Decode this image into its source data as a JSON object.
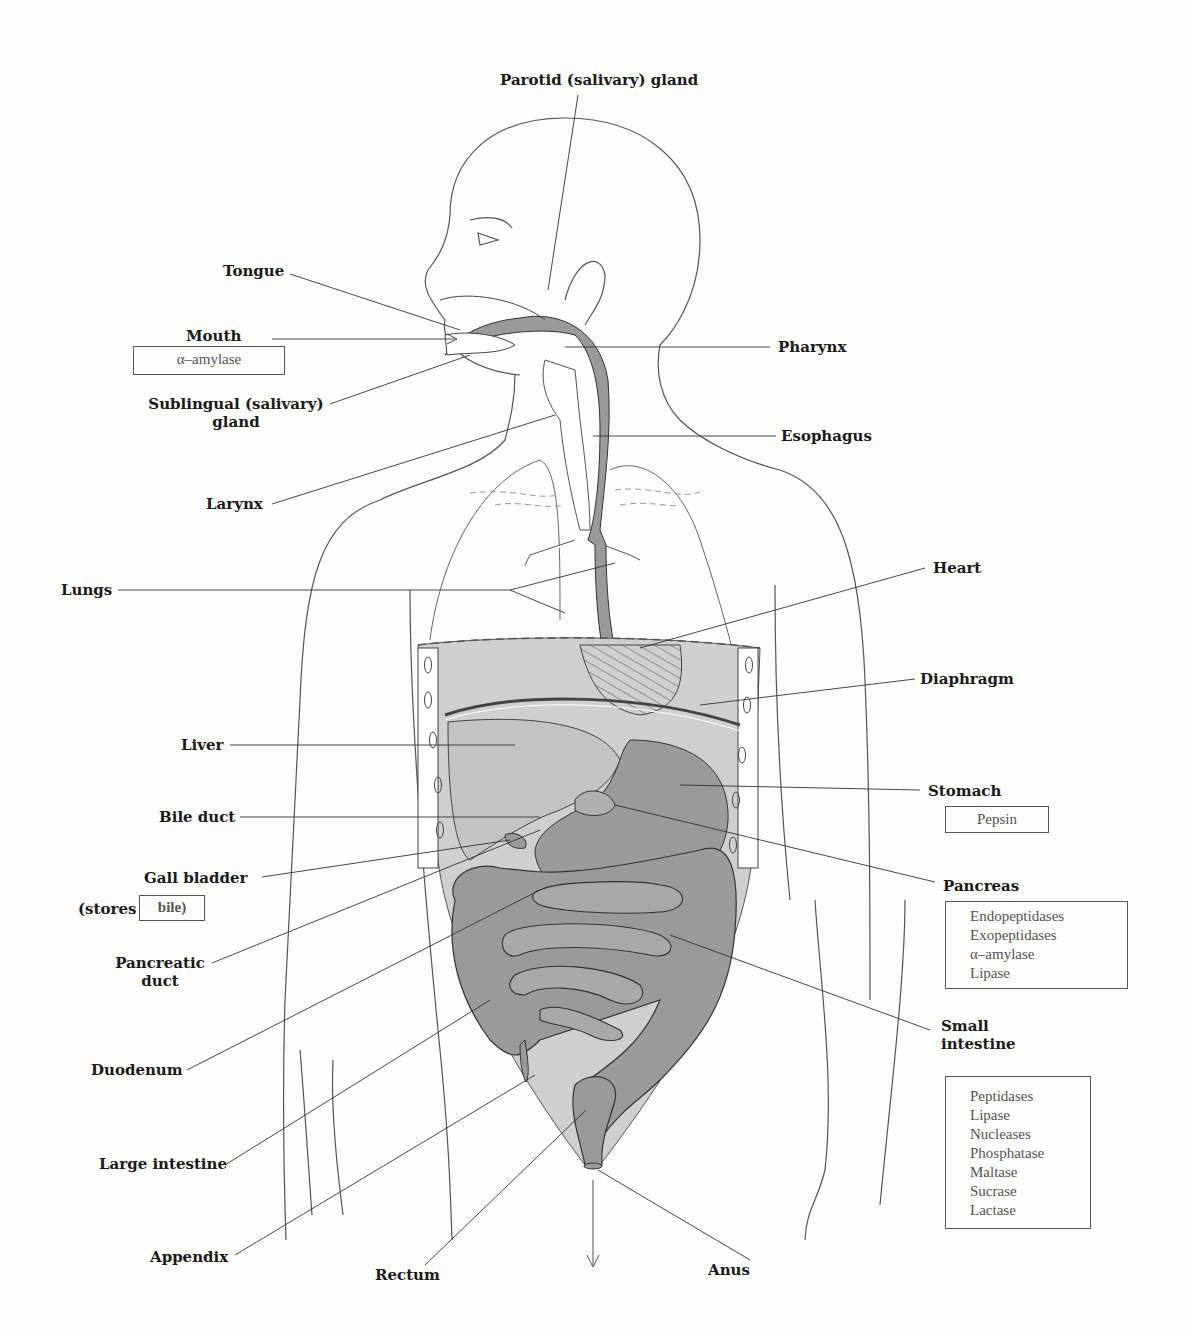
{
  "diagram": {
    "labels": {
      "parotid": "Parotid (salivary) gland",
      "tongue": "Tongue",
      "mouth": "Mouth",
      "sublingual_line1": "Sublingual (salivary)",
      "sublingual_line2": "gland",
      "larynx": "Larynx",
      "lungs": "Lungs",
      "liver": "Liver",
      "bile_duct": "Bile duct",
      "gall_bladder": "Gall bladder",
      "stores_prefix": "(stores",
      "pancreatic_duct_line1": "Pancreatic",
      "pancreatic_duct_line2": "duct",
      "duodenum": "Duodenum",
      "large_intestine": "Large intestine",
      "appendix": "Appendix",
      "rectum": "Rectum",
      "anus": "Anus",
      "pharynx": "Pharynx",
      "esophagus": "Esophagus",
      "heart": "Heart",
      "diaphragm": "Diaphragm",
      "stomach": "Stomach",
      "pancreas": "Pancreas",
      "small_intestine_line1": "Small",
      "small_intestine_line2": "intestine"
    },
    "enzyme_boxes": {
      "mouth": [
        "α–amylase"
      ],
      "gall_bladder": [
        "bile)"
      ],
      "stomach": [
        "Pepsin"
      ],
      "pancreas": [
        "Endopeptidases",
        "Exopeptidases",
        "α–amylase",
        "Lipase"
      ],
      "small_intestine": [
        "Peptidases",
        "Lipase",
        "Nucleases",
        "Phosphatase",
        "Maltase",
        "Sucrase",
        "Lactase"
      ]
    },
    "colors": {
      "outline": "#444444",
      "organ_fill": "#9a9a9a",
      "cavity_fill": "#cfcfcf",
      "enzyme_text": "#555555"
    }
  }
}
